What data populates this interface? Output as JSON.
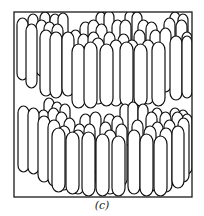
{
  "figure": {
    "caption": "(c)",
    "frame": {
      "x": 14,
      "y": 12,
      "width": 178,
      "height": 185,
      "stroke": "#1a1a1a"
    },
    "rod_style": {
      "fill": "#ffffff",
      "stroke": "#111111",
      "stroke_width": 1.2
    },
    "layers": [
      {
        "name": "top-layer",
        "rows": [
          {
            "depth": "back",
            "rods": [
              [
                28,
                14,
                10,
                46
              ],
              [
                40,
                12,
                10,
                40
              ],
              [
                50,
                14,
                10,
                42
              ],
              [
                58,
                13,
                10,
                40
              ],
              [
                96,
                12,
                10,
                42
              ],
              [
                104,
                11,
                10,
                40
              ],
              [
                125,
                11,
                10,
                42
              ],
              [
                132,
                12,
                10,
                40
              ],
              [
                170,
                12,
                10,
                42
              ],
              [
                178,
                14,
                10,
                40
              ]
            ]
          },
          {
            "depth": "middle-back",
            "rods": [
              [
                36,
                20,
                11,
                56
              ],
              [
                44,
                22,
                11,
                58
              ],
              [
                52,
                24,
                11,
                58
              ],
              [
                80,
                22,
                11,
                58
              ],
              [
                88,
                20,
                11,
                56
              ],
              [
                96,
                24,
                11,
                58
              ],
              [
                112,
                20,
                11,
                58
              ],
              [
                120,
                20,
                11,
                58
              ],
              [
                138,
                20,
                11,
                60
              ],
              [
                146,
                22,
                11,
                58
              ],
              [
                164,
                18,
                11,
                60
              ],
              [
                176,
                20,
                11,
                62
              ]
            ]
          },
          {
            "depth": "middle",
            "rods": [
              [
                17,
                18,
                11,
                62
              ],
              [
                70,
                30,
                11,
                62
              ],
              [
                78,
                34,
                11,
                64
              ],
              [
                88,
                32,
                11,
                64
              ],
              [
                104,
                32,
                11,
                64
              ],
              [
                118,
                34,
                11,
                64
              ],
              [
                134,
                30,
                11,
                66
              ],
              [
                150,
                30,
                11,
                66
              ],
              [
                160,
                28,
                11,
                64
              ],
              [
                182,
                32,
                10,
                64
              ]
            ]
          },
          {
            "depth": "middle-front",
            "rods": [
              [
                26,
                24,
                11,
                64
              ],
              [
                40,
                30,
                12,
                66
              ],
              [
                50,
                32,
                12,
                66
              ],
              [
                62,
                32,
                12,
                64
              ],
              [
                92,
                38,
                12,
                66
              ],
              [
                110,
                40,
                12,
                66
              ],
              [
                126,
                40,
                12,
                66
              ],
              [
                142,
                40,
                12,
                64
              ],
              [
                170,
                36,
                12,
                64
              ],
              [
                182,
                36,
                10,
                62
              ]
            ]
          },
          {
            "depth": "front",
            "rods": [
              [
                72,
                44,
                13,
                64
              ],
              [
                84,
                42,
                13,
                66
              ],
              [
                100,
                44,
                13,
                62
              ],
              [
                120,
                42,
                13,
                64
              ],
              [
                134,
                44,
                13,
                62
              ],
              [
                152,
                42,
                13,
                64
              ]
            ]
          }
        ]
      },
      {
        "name": "bottom-layer",
        "rows": [
          {
            "depth": "back",
            "rods": [
              [
                44,
                98,
                10,
                42
              ],
              [
                52,
                102,
                10,
                40
              ],
              [
                60,
                104,
                10,
                42
              ],
              [
                120,
                104,
                10,
                42
              ],
              [
                128,
                102,
                10,
                42
              ],
              [
                138,
                104,
                10,
                40
              ],
              [
                152,
                108,
                10,
                40
              ],
              [
                170,
                108,
                10,
                40
              ],
              [
                178,
                110,
                10,
                40
              ]
            ]
          },
          {
            "depth": "middle-back",
            "rods": [
              [
                38,
                110,
                11,
                58
              ],
              [
                48,
                108,
                11,
                58
              ],
              [
                56,
                112,
                11,
                58
              ],
              [
                80,
                114,
                11,
                60
              ],
              [
                90,
                112,
                11,
                60
              ],
              [
                104,
                114,
                11,
                60
              ],
              [
                112,
                116,
                11,
                58
              ],
              [
                146,
                112,
                11,
                60
              ],
              [
                160,
                112,
                11,
                60
              ],
              [
                172,
                112,
                11,
                62
              ],
              [
                182,
                114,
                10,
                60
              ]
            ]
          },
          {
            "depth": "middle",
            "rods": [
              [
                18,
                106,
                11,
                66
              ],
              [
                28,
                108,
                11,
                66
              ],
              [
                64,
                118,
                11,
                62
              ],
              [
                74,
                124,
                11,
                64
              ],
              [
                84,
                124,
                11,
                64
              ],
              [
                100,
                122,
                11,
                64
              ],
              [
                116,
                124,
                11,
                62
              ],
              [
                132,
                120,
                11,
                64
              ],
              [
                152,
                122,
                11,
                64
              ],
              [
                164,
                120,
                11,
                66
              ],
              [
                178,
                118,
                11,
                64
              ]
            ]
          },
          {
            "depth": "middle-front",
            "rods": [
              [
                38,
                116,
                12,
                66
              ],
              [
                48,
                120,
                12,
                66
              ],
              [
                58,
                126,
                12,
                64
              ],
              [
                72,
                130,
                12,
                64
              ],
              [
                104,
                130,
                12,
                64
              ],
              [
                128,
                130,
                12,
                64
              ],
              [
                144,
                126,
                12,
                66
              ],
              [
                160,
                128,
                12,
                64
              ],
              [
                172,
                126,
                12,
                62
              ]
            ]
          },
          {
            "depth": "front",
            "rods": [
              [
                52,
                128,
                13,
                64
              ],
              [
                66,
                132,
                13,
                62
              ],
              [
                82,
                132,
                13,
                64
              ],
              [
                96,
                134,
                13,
                62
              ],
              [
                112,
                136,
                13,
                60
              ],
              [
                140,
                134,
                13,
                62
              ],
              [
                154,
                136,
                13,
                60
              ]
            ]
          }
        ]
      }
    ]
  }
}
